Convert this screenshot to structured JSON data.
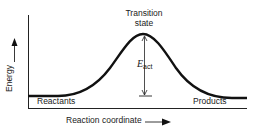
{
  "diagram": {
    "labels": {
      "transition_state_line1": "Transition",
      "transition_state_line2": "state",
      "reactants": "Reactants",
      "products": "Products",
      "x_axis": "Reaction coordinate",
      "y_axis": "Energy",
      "activation_energy_symbol": "E",
      "activation_energy_subscript": "act"
    },
    "icons": {
      "y_axis_arrow": "arrow-up-icon",
      "x_axis_arrow": "arrow-right-icon",
      "eact_arrow": "double-headed-arrow-icon"
    },
    "colors": {
      "line": "#111111",
      "background": "#ffffff"
    }
  }
}
